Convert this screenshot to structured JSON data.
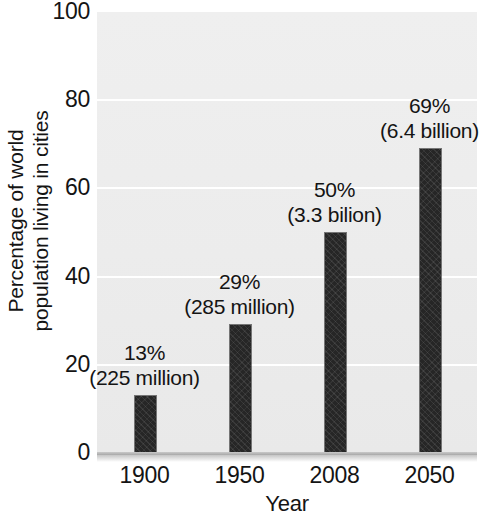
{
  "chart_data": {
    "type": "bar",
    "title": "",
    "subtitle": "",
    "xlabel": "Year",
    "ylabel": "Percentage of world population living in cities",
    "ylabel_line1": "Percentage of world",
    "ylabel_line2": "population living in cities",
    "categories": [
      "1900",
      "1950",
      "2008",
      "2050"
    ],
    "values": [
      13,
      29,
      50,
      69
    ],
    "point_labels": [
      {
        "percent": "13%",
        "absolute": "(225 million)"
      },
      {
        "percent": "29%",
        "absolute": "(285 million)"
      },
      {
        "percent": "50%",
        "absolute": "(3.3 bilion)"
      },
      {
        "percent": "69%",
        "absolute": "(6.4 billion)"
      }
    ],
    "ylim": [
      0,
      100
    ],
    "ytick_labels": [
      "0",
      "20",
      "40",
      "60",
      "80",
      "100"
    ],
    "ytick_values": [
      0,
      20,
      40,
      60,
      80,
      100
    ],
    "grid": true,
    "grid_color": "#ffffff",
    "legend": null,
    "bar_color": "#262626",
    "plot_background": "#eeeeee",
    "figure_background": "#ffffff"
  }
}
